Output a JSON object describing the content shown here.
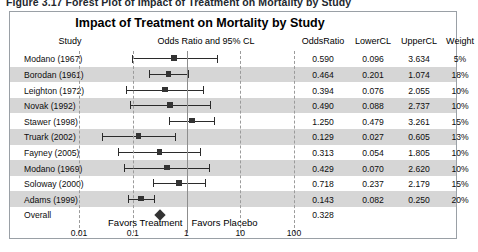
{
  "figure": {
    "caption": "Figure 3.17    Forest Plot of Impact of Treatment on Mortality by Study",
    "title": "Impact of Treatment on Mortality by Study"
  },
  "columns": {
    "study": "Study",
    "plot": "Odds Ratio and 95% CL",
    "odds_ratio": "OddsRatio",
    "lower_cl": "LowerCL",
    "upper_cl": "UpperCL",
    "weight": "Weight"
  },
  "axis": {
    "ticks": [
      "0.01",
      "0.1",
      "1",
      "10",
      "100"
    ],
    "favors_left": "Favors Treatment",
    "favors_right": "Favors Placebo"
  },
  "colors": {
    "band": "#d6d6d6",
    "marker": "#333333",
    "gridline": "#9b9b9b",
    "refline": "#8d8d8d",
    "border": "#9aa0a6"
  },
  "chart_data": {
    "type": "forest",
    "title": "Impact of Treatment on Mortality by Study",
    "xlabel": "Odds Ratio and 95% CL",
    "ylabel": "Study",
    "xscale": "log",
    "xlim": [
      0.01,
      100
    ],
    "xticks": [
      0.01,
      0.1,
      1,
      10,
      100
    ],
    "reference_line": 1,
    "grid": true,
    "annotations": [
      "Favors Treatment",
      "Favors Placebo"
    ],
    "categories": [
      "Modano  (1967)",
      "Borodan (1961)",
      "Leighton (1972)",
      "Novak   (1992)",
      "Stawer  (1998)",
      "Truark  (2002)",
      "Fayney  (2005)",
      "Modano  (1969)",
      "Soloway (2000)",
      "Adams   (1999)",
      "Overall"
    ],
    "rows": [
      {
        "study": "Modano  (1967)",
        "odds_ratio": 0.59,
        "lower_cl": 0.096,
        "upper_cl": 3.634,
        "weight": "5%",
        "or_label": "0.590",
        "lcl_label": "0.096",
        "ucl_label": "3.634",
        "summary": false
      },
      {
        "study": "Borodan (1961)",
        "odds_ratio": 0.464,
        "lower_cl": 0.201,
        "upper_cl": 1.074,
        "weight": "18%",
        "or_label": "0.464",
        "lcl_label": "0.201",
        "ucl_label": "1.074",
        "summary": false
      },
      {
        "study": "Leighton (1972)",
        "odds_ratio": 0.394,
        "lower_cl": 0.076,
        "upper_cl": 2.055,
        "weight": "10%",
        "or_label": "0.394",
        "lcl_label": "0.076",
        "ucl_label": "2.055",
        "summary": false
      },
      {
        "study": "Novak   (1992)",
        "odds_ratio": 0.49,
        "lower_cl": 0.088,
        "upper_cl": 2.737,
        "weight": "10%",
        "or_label": "0.490",
        "lcl_label": "0.088",
        "ucl_label": "2.737",
        "summary": false
      },
      {
        "study": "Stawer  (1998)",
        "odds_ratio": 1.25,
        "lower_cl": 0.479,
        "upper_cl": 3.261,
        "weight": "15%",
        "or_label": "1.250",
        "lcl_label": "0.479",
        "ucl_label": "3.261",
        "summary": false
      },
      {
        "study": "Truark  (2002)",
        "odds_ratio": 0.129,
        "lower_cl": 0.027,
        "upper_cl": 0.605,
        "weight": "13%",
        "or_label": "0.129",
        "lcl_label": "0.027",
        "ucl_label": "0.605",
        "summary": false
      },
      {
        "study": "Fayney  (2005)",
        "odds_ratio": 0.313,
        "lower_cl": 0.054,
        "upper_cl": 1.805,
        "weight": "10%",
        "or_label": "0.313",
        "lcl_label": "0.054",
        "ucl_label": "1.805",
        "summary": false
      },
      {
        "study": "Modano  (1969)",
        "odds_ratio": 0.429,
        "lower_cl": 0.07,
        "upper_cl": 2.62,
        "weight": "10%",
        "or_label": "0.429",
        "lcl_label": "0.070",
        "ucl_label": "2.620",
        "summary": false
      },
      {
        "study": "Soloway (2000)",
        "odds_ratio": 0.718,
        "lower_cl": 0.237,
        "upper_cl": 2.179,
        "weight": "15%",
        "or_label": "0.718",
        "lcl_label": "0.237",
        "ucl_label": "2.179",
        "summary": false
      },
      {
        "study": "Adams   (1999)",
        "odds_ratio": 0.143,
        "lower_cl": 0.082,
        "upper_cl": 0.25,
        "weight": "20%",
        "or_label": "0.143",
        "lcl_label": "0.082",
        "ucl_label": "0.250",
        "summary": false
      },
      {
        "study": "Overall",
        "odds_ratio": 0.328,
        "lower_cl": null,
        "upper_cl": null,
        "weight": "",
        "or_label": "0.328",
        "lcl_label": "",
        "ucl_label": "",
        "summary": true
      }
    ]
  }
}
